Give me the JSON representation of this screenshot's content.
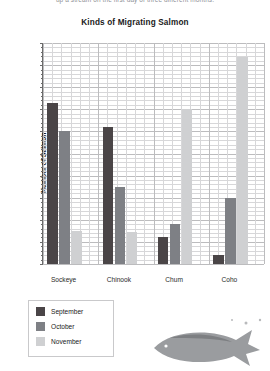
{
  "intro_text": "up a stream on the first day of three different months.",
  "axis": {
    "y_title": "Number of Salmon",
    "y_ticks": [
      "1,000",
      "900",
      "800",
      "700",
      "600",
      "500",
      "400",
      "300",
      "200",
      "100",
      "0"
    ]
  },
  "legend": {
    "items": [
      {
        "label": "September",
        "color": "#4a4547",
        "key": "sep"
      },
      {
        "label": "October",
        "color": "#7e8085",
        "key": "oct"
      },
      {
        "label": "November",
        "color": "#cfd0d2",
        "key": "nov"
      }
    ]
  },
  "chart_data": {
    "type": "bar",
    "title": "Kinds of Migrating Salmon",
    "xlabel": "",
    "ylabel": "Number of Salmon",
    "ylim": [
      0,
      1000
    ],
    "ytick_step": 100,
    "grid": true,
    "legend_position": "below-left",
    "categories": [
      "Sockeye",
      "Chinook",
      "Chum",
      "Coho"
    ],
    "series": [
      {
        "name": "September",
        "color": "#4a4547",
        "values": [
          730,
          620,
          120,
          40
        ]
      },
      {
        "name": "October",
        "color": "#7e8085",
        "values": [
          600,
          350,
          180,
          300
        ]
      },
      {
        "name": "November",
        "color": "#cfd0d2",
        "values": [
          150,
          145,
          700,
          935
        ]
      }
    ]
  }
}
